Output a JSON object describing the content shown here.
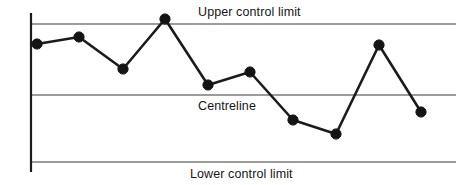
{
  "chart_data": {
    "type": "line",
    "title": "",
    "subtitle": "",
    "xlabel": "",
    "ylabel": "",
    "grid": false,
    "legend_position": "none",
    "x": [
      1,
      2,
      3,
      4,
      5,
      6,
      7,
      8,
      9,
      10
    ],
    "series": [
      {
        "name": "Sample measurement",
        "values": [
          0.71,
          0.81,
          0.49,
          1.06,
          0.3,
          0.5,
          -0.2,
          -0.4,
          0.73,
          -0.12
        ],
        "pixel_points": [
          {
            "x": 37,
            "y": 44
          },
          {
            "x": 79,
            "y": 37
          },
          {
            "x": 123,
            "y": 69
          },
          {
            "x": 165,
            "y": 19
          },
          {
            "x": 208,
            "y": 85
          },
          {
            "x": 250,
            "y": 72
          },
          {
            "x": 293,
            "y": 120
          },
          {
            "x": 336,
            "y": 134
          },
          {
            "x": 379,
            "y": 45
          },
          {
            "x": 421,
            "y": 112
          }
        ]
      }
    ],
    "reference_lines": [
      {
        "id": "ucl",
        "label": "Upper control limit",
        "value": 1.0,
        "pixel_y": 24
      },
      {
        "id": "centreline",
        "label": "Centreline",
        "value": 0.0,
        "pixel_y": 95
      },
      {
        "id": "lcl",
        "label": "Lower control limit",
        "value": -1.0,
        "pixel_y": 162
      }
    ],
    "ylim": [
      -1.3,
      1.25
    ],
    "xlim": [
      0,
      11
    ],
    "colors": {
      "series": "#141414",
      "limit_line": "#7b7b7b",
      "axis": "#1b1b1b",
      "background": "#ffffff",
      "text": "#161616"
    }
  },
  "labels": {
    "upper_control_limit": "Upper control limit",
    "centreline": "Centreline",
    "lower_control_limit": "Lower control limit"
  }
}
